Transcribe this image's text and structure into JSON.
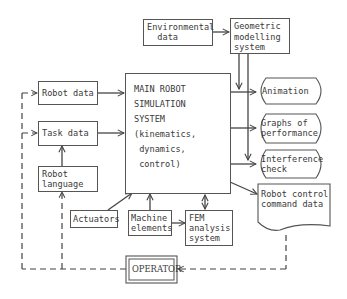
{
  "diagram": {
    "nodes": {
      "environmental_data": "Environmental\n  data",
      "geometric_modelling": "Geometric\nmodelling\nsystem",
      "robot_data": "Robot data",
      "task_data": "Task data",
      "robot_language": "Robot\nlanguage",
      "main_line1": "MAIN ROBOT",
      "main_line2": "SIMULATION",
      "main_line3": "SYSTEM",
      "main_line4": "(kinematics,",
      "main_line5": " dynamics,",
      "main_line6": " control)",
      "animation": "Animation",
      "graphs_of_performance": "Graphs of\nperformance",
      "interference_check": "Interference\ncheck",
      "robot_control_command_data": "Robot control\ncommand data",
      "actuators": "Actuators",
      "machine_elements": "Machine\nelements",
      "fem_analysis": "FEM\nanalysis\nsystem",
      "operator": "OPERATOR"
    },
    "edges": [
      {
        "from": "Environmental data",
        "to": "Geometric modelling system",
        "style": "solid"
      },
      {
        "from": "Geometric modelling system",
        "to": "Animation",
        "style": "solid"
      },
      {
        "from": "Geometric modelling system",
        "to": "Interference check",
        "style": "solid"
      },
      {
        "from": "Robot data",
        "to": "MAIN ROBOT SIMULATION SYSTEM",
        "style": "solid"
      },
      {
        "from": "Task data",
        "to": "MAIN ROBOT SIMULATION SYSTEM",
        "style": "solid"
      },
      {
        "from": "Robot language",
        "to": "Task data",
        "style": "solid"
      },
      {
        "from": "MAIN ROBOT SIMULATION SYSTEM",
        "to": "Animation",
        "style": "solid"
      },
      {
        "from": "MAIN ROBOT SIMULATION SYSTEM",
        "to": "Graphs of performance",
        "style": "solid"
      },
      {
        "from": "MAIN ROBOT SIMULATION SYSTEM",
        "to": "Interference check",
        "style": "solid"
      },
      {
        "from": "MAIN ROBOT SIMULATION SYSTEM",
        "to": "Robot control command data",
        "style": "solid"
      },
      {
        "from": "Actuators",
        "to": "MAIN ROBOT SIMULATION SYSTEM",
        "style": "solid"
      },
      {
        "from": "Machine elements",
        "to": "MAIN ROBOT SIMULATION SYSTEM",
        "style": "solid"
      },
      {
        "from": "Machine elements",
        "to": "FEM analysis system",
        "style": "solid"
      },
      {
        "from": "FEM analysis system",
        "to": "MAIN ROBOT SIMULATION SYSTEM",
        "style": "solid-bidirectional"
      },
      {
        "from": "Robot control command data",
        "to": "OPERATOR",
        "style": "dashed"
      },
      {
        "from": "OPERATOR",
        "to": "Robot data",
        "style": "dashed"
      },
      {
        "from": "OPERATOR",
        "to": "Task data",
        "style": "dashed"
      },
      {
        "from": "OPERATOR",
        "to": "Robot language",
        "style": "dashed"
      }
    ]
  }
}
